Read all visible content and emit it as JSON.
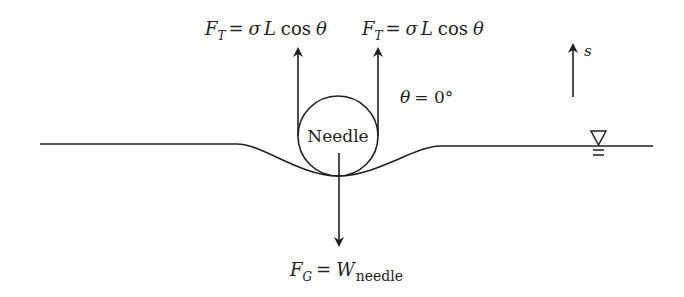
{
  "diagram": {
    "colors": {
      "ink": "#231f20",
      "background": "#ffffff"
    },
    "needle": {
      "label": "Needle"
    },
    "tension_left": {
      "F": "F",
      "sub": "T",
      "rhs_sigma": "σ",
      "rhs_L": "L",
      "rhs_cos": "cos",
      "rhs_theta": "θ",
      "eq": "="
    },
    "tension_right": {
      "F": "F",
      "sub": "T",
      "rhs_sigma": "σ",
      "rhs_L": "L",
      "rhs_cos": "cos",
      "rhs_theta": "θ",
      "eq": "="
    },
    "contact_angle": {
      "theta": "θ",
      "rest": "= 0°"
    },
    "gravity": {
      "F": "F",
      "sub": "G",
      "eq": "=",
      "W": "W",
      "wsub": "needle"
    },
    "s_axis": {
      "label": "s"
    },
    "water_surface_symbol": "free-surface-triangle"
  }
}
